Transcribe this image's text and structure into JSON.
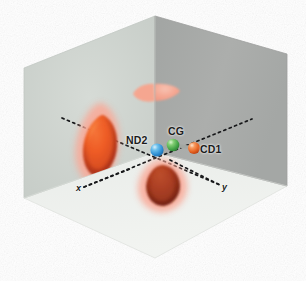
{
  "figure": {
    "width": 306,
    "height": 281,
    "background": "#ffffff"
  },
  "box": {
    "type": "isometric-corner",
    "faces": [
      {
        "name": "left-wall",
        "fill": "#cdd3ce",
        "edge": "#b8bfba"
      },
      {
        "name": "right-wall",
        "fill": "#a8aaa8",
        "edge": "#989a98"
      },
      {
        "name": "floor",
        "fill": "#eef1ee",
        "edge": "#dfe3df"
      }
    ],
    "vertices": {
      "top": [
        155,
        16
      ],
      "left_top": [
        24,
        68
      ],
      "right_top": [
        287,
        54
      ],
      "center": [
        155,
        152
      ],
      "left_bottom": [
        24,
        198
      ],
      "right_bottom": [
        287,
        186
      ],
      "bottom": [
        155,
        258
      ]
    }
  },
  "atoms": [
    {
      "id": "ND2",
      "label": "ND2",
      "color": "#3f9fe0",
      "highlight": "#bfe4f7",
      "x": 157,
      "y": 150,
      "r": 6.6
    },
    {
      "id": "CG",
      "label": "CG",
      "color": "#4cb050",
      "highlight": "#c8ecc2",
      "x": 173,
      "y": 145,
      "r": 6.3
    },
    {
      "id": "CD1",
      "label": "CD1",
      "color": "#e8642a",
      "highlight": "#fbd3bb",
      "x": 194,
      "y": 148,
      "r": 6.0
    }
  ],
  "bonds": [
    {
      "from": "ND2",
      "to": "CG",
      "color": "#9aa09a"
    },
    {
      "from": "CG",
      "to": "CD1",
      "color": "#9aa09a"
    }
  ],
  "axes": [
    {
      "name": "x",
      "label": "x",
      "color": "#1b1b1b",
      "style": "dashed",
      "from": [
        86,
        186
      ],
      "to": [
        250,
        120
      ]
    },
    {
      "name": "y",
      "label": "y",
      "color": "#1b1b1b",
      "style": "dashed",
      "from": [
        60,
        118
      ],
      "to": [
        218,
        184
      ]
    }
  ],
  "density_blobs": [
    {
      "name": "blob-left-wall",
      "halo": "#f9a896",
      "core": "#b7381b",
      "core_light": "#f2622f",
      "cx": 100,
      "cy": 146
    },
    {
      "name": "blob-floor",
      "halo": "#f9a896",
      "core": "#8f2c18",
      "core_light": "#b84a27",
      "cx": 163,
      "cy": 186
    },
    {
      "name": "blob-back-upper",
      "halo": "#f9ab98",
      "core": "#f9ab98",
      "core_light": "#fbbfae",
      "cx": 157,
      "cy": 92
    }
  ],
  "colors": {
    "left_wall": "#cdd3ce",
    "right_wall": "#a8aaa8",
    "floor": "#eef1ee",
    "atom_n": "#3f9fe0",
    "atom_c_gamma": "#4cb050",
    "atom_c_delta": "#e8642a",
    "density_halo": "#f9a896",
    "density_core": "#b7381b",
    "label_text": "#1b1b1b"
  }
}
